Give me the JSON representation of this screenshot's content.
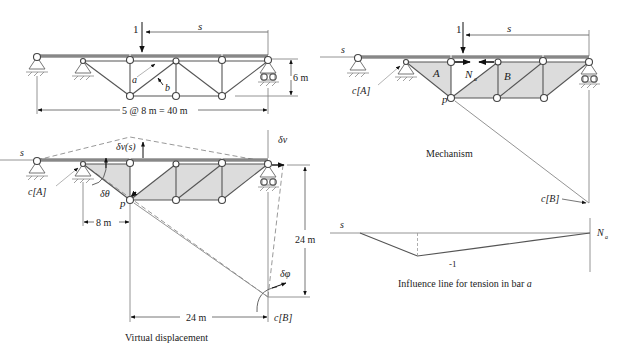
{
  "panels": {
    "structure": {
      "load_label": "1",
      "s_label": "s",
      "bar_a_label": "a",
      "bar_b_label": "b",
      "height_label": "6 m",
      "span_label": "5 @ 8 m = 40 m"
    },
    "mechanism": {
      "s_left_label": "s",
      "load_label": "1",
      "s_top_label": "s",
      "c_a_label": "c[A]",
      "body_a_label": "A",
      "body_b_label": "B",
      "force_label": "N",
      "force_sub": "a",
      "p_label": "p",
      "c_b_label": "c[B]",
      "caption": "Mechanism"
    },
    "virtual_displacement": {
      "s_label": "s",
      "dv_s_label": "δv(s)",
      "dv_label": "δv",
      "c_a_label": "c[A]",
      "dtheta_label": "δθ",
      "p_label": "p",
      "dim_8m": "8 m",
      "dim_24m_vertical": "24 m",
      "dim_24m_horizontal": "24 m",
      "dphi_label": "δφ",
      "c_b_label": "c[B]",
      "caption": "Virtual displacement"
    },
    "influence_line": {
      "s_label": "s",
      "n_label": "N",
      "n_sub": "a",
      "min_value_label": "-1",
      "caption_prefix": "Influence line for tension in bar ",
      "caption_bar": "a"
    }
  },
  "chart_data": {
    "type": "line",
    "title": "Influence line for tension in bar a",
    "xlabel": "s",
    "ylabel": "N_a",
    "x": [
      0,
      8,
      16,
      24,
      32,
      40
    ],
    "y": [
      0,
      0,
      -1,
      -0.6667,
      -0.3333,
      0
    ],
    "annotations": [
      "-1"
    ]
  }
}
